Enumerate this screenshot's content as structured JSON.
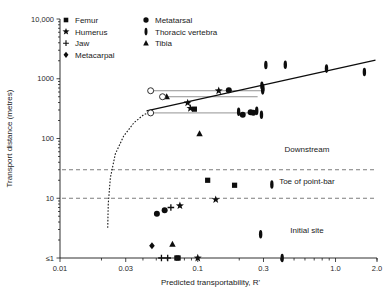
{
  "chart_data": {
    "type": "scatter",
    "title": "",
    "xlabel": "Predicted transportability,  R'",
    "ylabel": "Transport distance (metres)",
    "xscale": "log",
    "yscale": "log",
    "xlim": [
      0.01,
      2.0
    ],
    "ylim": [
      1,
      10000
    ],
    "grid": false,
    "legend_position": "top-left-inside",
    "x_ticks": [
      "0.01",
      "0.03",
      "0.1",
      "0.3",
      "1.0",
      "2.0"
    ],
    "x_tick_values": [
      0.01,
      0.03,
      0.1,
      0.3,
      1.0,
      2.0
    ],
    "y_ticks": [
      "10,000",
      "1000",
      "100",
      "10",
      "≤1"
    ],
    "y_tick_values": [
      10000,
      1000,
      100,
      10,
      1
    ],
    "legend": [
      {
        "label": "Femur",
        "marker": "square"
      },
      {
        "label": "Humerus",
        "marker": "star"
      },
      {
        "label": "Jaw",
        "marker": "plus"
      },
      {
        "label": "Metacarpal",
        "marker": "diamond"
      },
      {
        "label": "Metatarsal",
        "marker": "circle"
      },
      {
        "label": "Thoracic vertebra",
        "marker": "vbar"
      },
      {
        "label": "Tibia",
        "marker": "triangle"
      }
    ],
    "zones": [
      {
        "label": "Downstream",
        "x": 0.62,
        "y": 60
      },
      {
        "label": "Toe of point-bar",
        "x": 0.62,
        "y": 17
      },
      {
        "label": "Initial site",
        "x": 0.62,
        "y": 2.6
      }
    ],
    "zone_dividers": [
      {
        "y": 30,
        "style": "dashed"
      },
      {
        "y": 10,
        "style": "dashed"
      }
    ],
    "trend_line": {
      "x0": 0.0425,
      "y0": 290,
      "x1": 1.95,
      "y1": 2050,
      "style": "solid"
    },
    "threshold_curve": {
      "style": "dashed",
      "points": [
        [
          0.0222,
          3.2
        ],
        [
          0.0224,
          8
        ],
        [
          0.0232,
          22
        ],
        [
          0.0252,
          55
        ],
        [
          0.029,
          110
        ],
        [
          0.0345,
          185
        ],
        [
          0.0405,
          250
        ],
        [
          0.047,
          290
        ]
      ]
    },
    "connectors": [
      {
        "x0": 0.0455,
        "x1": 0.288,
        "y": 630
      },
      {
        "x0": 0.0555,
        "x1": 0.272,
        "y": 500
      },
      {
        "x0": 0.0455,
        "x1": 0.253,
        "y": 268
      }
    ],
    "series": [
      {
        "name": "Femur",
        "marker": "square",
        "points": [
          [
            0.0945,
            310
          ],
          [
            0.118,
            20
          ],
          [
            0.185,
            16.5
          ],
          [
            0.072,
            1
          ],
          [
            0.0705,
            1
          ]
        ]
      },
      {
        "name": "Humerus",
        "marker": "star",
        "points": [
          [
            0.0845,
            395
          ],
          [
            0.142,
            630
          ],
          [
            0.0885,
            320
          ],
          [
            0.135,
            9.5
          ],
          [
            0.0742,
            7.5
          ],
          [
            0.1,
            1
          ]
        ]
      },
      {
        "name": "Jaw",
        "marker": "plus",
        "points": [
          [
            0.0638,
            7.0
          ],
          [
            0.0545,
            1
          ],
          [
            0.0605,
            1
          ]
        ]
      },
      {
        "name": "Metacarpal",
        "marker": "diamond",
        "points": [
          [
            0.0465,
            1.6
          ]
        ]
      },
      {
        "name": "Metatarsal",
        "marker": "circle",
        "points": [
          [
            0.168,
            640
          ],
          [
            0.242,
            275
          ],
          [
            0.253,
            270
          ],
          [
            0.212,
            250
          ],
          [
            0.0505,
            5.5
          ],
          [
            0.0575,
            6.3
          ]
        ]
      },
      {
        "name": "Thoracic vertebra",
        "marker": "vbar",
        "points": [
          [
            0.312,
            1700
          ],
          [
            0.432,
            1720
          ],
          [
            0.86,
            1480
          ],
          [
            1.62,
            1300
          ],
          [
            0.292,
            760
          ],
          [
            0.297,
            700
          ],
          [
            0.296,
            640
          ],
          [
            0.198,
            280
          ],
          [
            0.268,
            290
          ],
          [
            0.29,
            250
          ],
          [
            0.345,
            17
          ],
          [
            0.286,
            2.5
          ],
          [
            0.41,
            1
          ]
        ]
      },
      {
        "name": "Tibia",
        "marker": "triangle",
        "points": [
          [
            0.0595,
            500
          ],
          [
            0.103,
            120
          ],
          [
            0.0655,
            1.7
          ]
        ]
      }
    ],
    "open_markers": [
      {
        "x": 0.0455,
        "y": 630,
        "marker": "circle-open"
      },
      {
        "x": 0.0555,
        "y": 500,
        "marker": "circle-open"
      },
      {
        "x": 0.0455,
        "y": 268,
        "marker": "circle-open"
      }
    ]
  }
}
